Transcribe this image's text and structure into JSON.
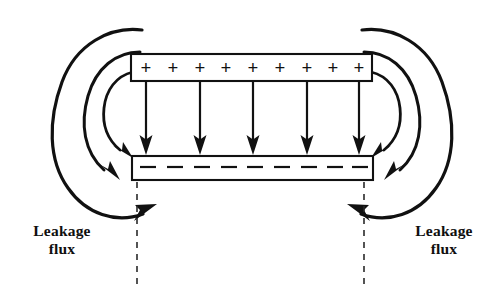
{
  "figure": {
    "background_color": "#ffffff",
    "ink_color": "#111111",
    "width": 496,
    "height": 303
  },
  "top_plate": {
    "name": "positive-plate",
    "charge_symbol": "+",
    "charge_count": 9,
    "signs": [
      "+",
      "+",
      "+",
      "+",
      "+",
      "+",
      "+",
      "+",
      "+"
    ],
    "x": 131,
    "y": 54,
    "width": 241,
    "height": 27
  },
  "bottom_plate": {
    "name": "negative-plate",
    "charge_symbol": "–",
    "charge_count": 9,
    "signs": [
      "–",
      "–",
      "–",
      "–",
      "–",
      "–",
      "–",
      "–",
      "–"
    ],
    "x": 132,
    "y": 156,
    "width": 241,
    "height": 24
  },
  "field_arrows": {
    "name": "uniform-field-arrows",
    "count": 5,
    "direction": "down",
    "x_positions": [
      146,
      200,
      253,
      307,
      359
    ],
    "y_start": 82,
    "y_end": 155
  },
  "leakage_arcs": {
    "left_count": 3,
    "right_count": 3,
    "description": "fringing field lines curving from the positive plate edge around to the negative plate edge"
  },
  "dashed_guides": {
    "name": "plate-edge-guides",
    "left_x": 137,
    "right_x": 364,
    "y_top": 182,
    "y_bottom": 288
  },
  "labels": {
    "left": {
      "line1": "Leakage",
      "line2": "flux"
    },
    "right": {
      "line1": "Leakage",
      "line2": "flux"
    }
  }
}
